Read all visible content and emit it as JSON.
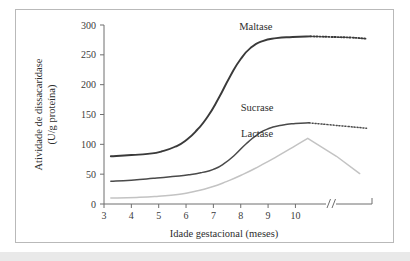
{
  "figure": {
    "background_color": "#ffffff",
    "frame_border_color": "#b9b9b9",
    "bottom_strip_color": "#e9e9e9"
  },
  "chart_data": {
    "type": "line",
    "title": "",
    "subtitle": "",
    "xlabel": "Idade gestacional (meses)",
    "ylabel": "Atividade de dissacaridase\n(U/g proteína)",
    "ylabel_line1": "Atividade de dissacaridase",
    "ylabel_line2": "(U/g proteína)",
    "xlim": [
      3,
      12.8
    ],
    "ylim": [
      0,
      300
    ],
    "grid": false,
    "legend": "inline-labels",
    "x_ticks": [
      3,
      4,
      5,
      6,
      7,
      8,
      9,
      10
    ],
    "x_tick_labels": [
      "3",
      "4",
      "5",
      "6",
      "7",
      "8",
      "9",
      "10"
    ],
    "y_ticks": [
      0,
      50,
      100,
      150,
      200,
      250,
      300
    ],
    "y_tick_labels": [
      "0",
      "50",
      "100",
      "150",
      "200",
      "250",
      "300"
    ],
    "axis_break": {
      "present": true,
      "symbol": "//",
      "x_position": 11.3,
      "note": "x-axis broken after month 10, resumes at term/postnatal"
    },
    "series": [
      {
        "name": "Maltase",
        "color": "#3a3a3a",
        "width": 1.9,
        "label_x": 8.55,
        "label_y": 292,
        "solid_points": [
          {
            "x": 3.25,
            "y": 80
          },
          {
            "x": 4.0,
            "y": 82
          },
          {
            "x": 4.6,
            "y": 84
          },
          {
            "x": 5.1,
            "y": 88
          },
          {
            "x": 5.6,
            "y": 96
          },
          {
            "x": 6.0,
            "y": 107
          },
          {
            "x": 6.4,
            "y": 124
          },
          {
            "x": 6.8,
            "y": 147
          },
          {
            "x": 7.2,
            "y": 178
          },
          {
            "x": 7.6,
            "y": 213
          },
          {
            "x": 8.0,
            "y": 243
          },
          {
            "x": 8.4,
            "y": 263
          },
          {
            "x": 8.8,
            "y": 273
          },
          {
            "x": 9.3,
            "y": 278
          },
          {
            "x": 9.9,
            "y": 280
          },
          {
            "x": 10.55,
            "y": 281
          }
        ],
        "dotted_points": [
          {
            "x": 10.55,
            "y": 281
          },
          {
            "x": 11.3,
            "y": 280
          },
          {
            "x": 12.0,
            "y": 279
          },
          {
            "x": 12.6,
            "y": 277
          }
        ]
      },
      {
        "name": "Sucrase",
        "color": "#4a4a4a",
        "width": 1.5,
        "label_x": 8.6,
        "label_y": 156,
        "solid_points": [
          {
            "x": 3.25,
            "y": 38
          },
          {
            "x": 4.0,
            "y": 40
          },
          {
            "x": 4.8,
            "y": 43
          },
          {
            "x": 5.5,
            "y": 46
          },
          {
            "x": 6.1,
            "y": 49
          },
          {
            "x": 6.6,
            "y": 53
          },
          {
            "x": 7.0,
            "y": 58
          },
          {
            "x": 7.4,
            "y": 68
          },
          {
            "x": 7.8,
            "y": 83
          },
          {
            "x": 8.2,
            "y": 101
          },
          {
            "x": 8.6,
            "y": 116
          },
          {
            "x": 9.0,
            "y": 126
          },
          {
            "x": 9.5,
            "y": 132
          },
          {
            "x": 10.0,
            "y": 135
          },
          {
            "x": 10.5,
            "y": 136
          }
        ],
        "dotted_points": [
          {
            "x": 10.5,
            "y": 136
          },
          {
            "x": 11.2,
            "y": 133
          },
          {
            "x": 11.9,
            "y": 130
          },
          {
            "x": 12.6,
            "y": 127
          }
        ]
      },
      {
        "name": "Lactase",
        "color": "#c3c3c3",
        "width": 1.5,
        "label_x": 8.6,
        "label_y": 113,
        "solid_points": [
          {
            "x": 3.25,
            "y": 10
          },
          {
            "x": 4.2,
            "y": 11
          },
          {
            "x": 5.0,
            "y": 13
          },
          {
            "x": 5.7,
            "y": 16
          },
          {
            "x": 6.3,
            "y": 21
          },
          {
            "x": 6.9,
            "y": 28
          },
          {
            "x": 7.5,
            "y": 38
          },
          {
            "x": 8.1,
            "y": 50
          },
          {
            "x": 8.7,
            "y": 64
          },
          {
            "x": 9.3,
            "y": 79
          },
          {
            "x": 9.9,
            "y": 95
          },
          {
            "x": 10.45,
            "y": 110
          },
          {
            "x": 11.5,
            "y": 80
          },
          {
            "x": 12.35,
            "y": 51
          }
        ],
        "dotted_points": []
      }
    ]
  }
}
